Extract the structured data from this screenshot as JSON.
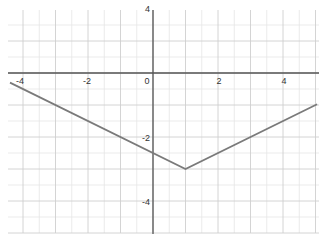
{
  "chart_data": {
    "type": "line",
    "title": "",
    "xlabel": "",
    "ylabel": "",
    "function": "y = 0.5*|x - 1| - 3",
    "xlim": [
      -4.6,
      5.05
    ],
    "ylim": [
      -5.0,
      2.0
    ],
    "grid": true,
    "legend": null,
    "x_ticks": [
      -4,
      -2,
      0,
      2,
      4
    ],
    "y_ticks": [
      4,
      -2,
      -4
    ],
    "x_tick_labels": [
      "-4",
      "-2",
      "0",
      "2",
      "4"
    ],
    "y_tick_labels": [
      "4",
      "-2",
      "-4"
    ],
    "series": [
      {
        "name": "y = ½|x−1| − 3",
        "color": "#7a7a7a",
        "x": [
          -4.4,
          1,
          5.05
        ],
        "y": [
          -0.3,
          -3,
          -0.975
        ]
      }
    ],
    "annotations": []
  },
  "labels": {
    "x": [
      "-4",
      "-2",
      "0",
      "2",
      "4"
    ],
    "y_top": "4",
    "y_neg2": "-2",
    "y_neg4": "-4"
  }
}
